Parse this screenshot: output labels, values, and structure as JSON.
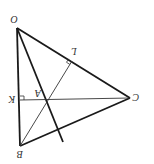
{
  "diagram": {
    "type": "geometry-triangle",
    "orientation": "rotated-180",
    "colors": {
      "stroke": "#1a1a1a",
      "label": "#333333",
      "background": "#ffffff"
    },
    "points": {
      "O": {
        "label": "O",
        "x": 17,
        "y": 28
      },
      "B": {
        "label": "B",
        "x": 20,
        "y": 146
      },
      "C": {
        "label": "C",
        "x": 130,
        "y": 98
      },
      "A": {
        "label": "A",
        "x": 45,
        "y": 99
      },
      "K": {
        "label": "K",
        "x": 20,
        "y": 100
      },
      "L": {
        "label": "L",
        "x": 72,
        "y": 61
      }
    },
    "segments": [
      {
        "from": "O",
        "to": "B",
        "weight": "thick"
      },
      {
        "from": "O",
        "to": "C",
        "weight": "thick"
      },
      {
        "from": "B",
        "to": "C",
        "weight": "thick"
      },
      {
        "from": "O",
        "to": "extended",
        "weight": "thick",
        "note": "line from O through A extended"
      },
      {
        "from": "C",
        "to": "K",
        "weight": "thin",
        "note": "altitude CK ⟂ OB"
      },
      {
        "from": "B",
        "to": "L",
        "weight": "thin",
        "note": "altitude BL ⟂ OC"
      }
    ],
    "right_angles": [
      "K",
      "L"
    ]
  }
}
